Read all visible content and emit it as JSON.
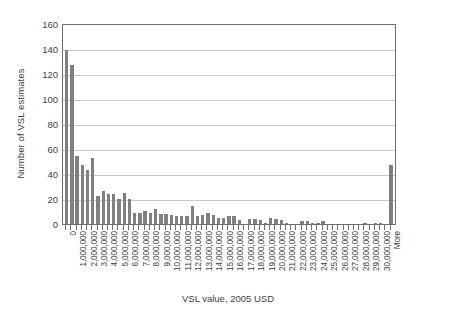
{
  "chart_data": {
    "type": "bar",
    "title": "",
    "subtitle": "",
    "xlabel": "VSL value, 2005 USD",
    "ylabel": "Number of VSL estimates",
    "ylim": [
      0,
      160
    ],
    "ytick_values": [
      0,
      20,
      40,
      60,
      80,
      100,
      120,
      140,
      160
    ],
    "ytick_labels": [
      "0",
      "20",
      "40",
      "60",
      "80",
      "100",
      "120",
      "140",
      "160"
    ],
    "grid": "horizontal",
    "legend": null,
    "bar_color": "#808080",
    "axis_color": "#6f6f6f",
    "gridline_color": "#c9c9c9",
    "bin_width_note": "0.5 million USD per bar; axis labels shown every 2 bars",
    "categories": [
      "0",
      "",
      "1,000,000",
      "",
      "2,000,000",
      "",
      "3,000,000",
      "",
      "4,000,000",
      "",
      "5,000,000",
      "",
      "6,000,000",
      "",
      "7,000,000",
      "",
      "8,000,000",
      "",
      "9,000,000",
      "",
      "10,000,000",
      "",
      "11,000,000",
      "",
      "12,000,000",
      "",
      "13,000,000",
      "",
      "14,000,000",
      "",
      "15,000,000",
      "",
      "16,000,000",
      "",
      "17,000,000",
      "",
      "18,000,000",
      "",
      "19,000,000",
      "",
      "20,000,000",
      "",
      "21,000,000",
      "",
      "22,000,000",
      "",
      "23,000,000",
      "",
      "24,000,000",
      "",
      "25,000,000",
      "",
      "26,000,000",
      "",
      "27,000,000",
      "",
      "28,000,000",
      "",
      "29,000,000",
      "",
      "30,000,000",
      "",
      "More"
    ],
    "tick_labels_visible": [
      "0",
      "1,000,000",
      "2,000,000",
      "3,000,000",
      "4,000,000",
      "5,000,000",
      "6,000,000",
      "7,000,000",
      "8,000,000",
      "9,000,000",
      "10,000,000",
      "11,000,000",
      "12,000,000",
      "13,000,000",
      "14,000,000",
      "15,000,000",
      "16,000,000",
      "17,000,000",
      "18,000,000",
      "19,000,000",
      "20,000,000",
      "21,000,000",
      "22,000,000",
      "23,000,000",
      "24,000,000",
      "25,000,000",
      "26,000,000",
      "27,000,000",
      "28,000,000",
      "29,000,000",
      "30,000,000",
      "More"
    ],
    "values": [
      140,
      128,
      55,
      48,
      44,
      54,
      23,
      27,
      25,
      25,
      21,
      26,
      21,
      10,
      10,
      11,
      10,
      13,
      9,
      9,
      8,
      7,
      7,
      7,
      15,
      7,
      8,
      10,
      8,
      6,
      6,
      7,
      7,
      4,
      0,
      5,
      5,
      4,
      2,
      6,
      5,
      4,
      2,
      1,
      1,
      3,
      3,
      2,
      2,
      3,
      1,
      0,
      0,
      1,
      1,
      1,
      1,
      2,
      1,
      2,
      2,
      1,
      48
    ]
  }
}
